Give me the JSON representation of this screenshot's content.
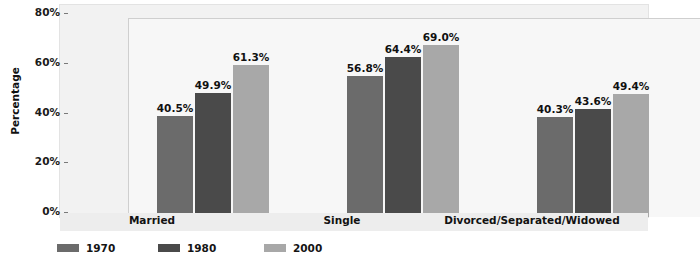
{
  "chart_data": {
    "type": "bar",
    "title": "",
    "xlabel": "",
    "ylabel": "Percentage",
    "ylim": [
      0,
      80
    ],
    "yticks": [
      "0%",
      "20%",
      "40%",
      "60%",
      "80%"
    ],
    "ytick_values": [
      0,
      20,
      40,
      60,
      80
    ],
    "grid": true,
    "minor_gridlines": [
      10,
      30,
      50,
      70
    ],
    "legend_position": "bottom-left",
    "categories": [
      "Married",
      "Single",
      "Divorced/Separated/Widowed"
    ],
    "series": [
      {
        "name": "1970",
        "color": "#6b6b6b",
        "values": [
          40.5,
          56.8,
          40.3
        ],
        "labels": [
          "40.5%",
          "56.8%",
          "40.3%"
        ]
      },
      {
        "name": "1980",
        "color": "#4a4a4a",
        "values": [
          49.9,
          64.4,
          43.6
        ],
        "labels": [
          "49.9%",
          "64.4%",
          "43.6%"
        ]
      },
      {
        "name": "2000",
        "color": "#a8a8a8",
        "values": [
          61.3,
          69.0,
          49.4
        ],
        "labels": [
          "61.3%",
          "69.0%",
          "49.4%"
        ]
      }
    ]
  }
}
